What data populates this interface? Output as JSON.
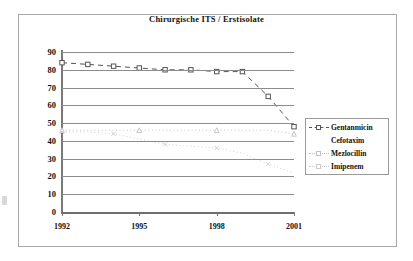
{
  "chart_data": {
    "type": "line",
    "title": "Chirurgische ITS / Erstisolate",
    "xlabel": "",
    "ylabel": "",
    "ylim": [
      0,
      90
    ],
    "yticks": [
      90,
      80,
      70,
      60,
      50,
      40,
      30,
      20,
      10,
      0
    ],
    "xticks": [
      "1992",
      "1995",
      "1998",
      "2001"
    ],
    "x": [
      1992,
      1993,
      1994,
      1995,
      1996,
      1997,
      1998,
      1999,
      2000,
      2001
    ],
    "grid": true,
    "legend_position": "right",
    "series": [
      {
        "name": "Gentanmicin",
        "marker": "square",
        "linestyle": "dashed",
        "color": "#555555",
        "values": [
          84,
          83,
          82,
          81,
          80,
          80,
          79,
          79,
          65,
          48
        ]
      },
      {
        "name": "Cefotaxim",
        "marker": "none",
        "linestyle": "none",
        "color": "#bfbfbf",
        "values": [
          null,
          null,
          null,
          null,
          null,
          null,
          null,
          null,
          null,
          null
        ]
      },
      {
        "name": "Mezlocillin",
        "marker": "triangle",
        "linestyle": "dotted",
        "color": "#c0c0c0",
        "values": [
          46,
          46,
          46,
          46,
          46,
          46,
          46,
          46,
          46,
          44
        ]
      },
      {
        "name": "Imipenem",
        "marker": "x",
        "linestyle": "dotted",
        "color": "#cccccc",
        "values": [
          45,
          45,
          44,
          41,
          38,
          37,
          36,
          33,
          27,
          22
        ]
      }
    ]
  },
  "legend": {
    "items": [
      {
        "label": "Gentanmicin"
      },
      {
        "label": "Cefotaxim"
      },
      {
        "label": "Mezlocillin"
      },
      {
        "label": "Imipenem"
      }
    ]
  },
  "axis": {
    "y_labels": [
      "90",
      "80",
      "70",
      "60",
      "50",
      "40",
      "30",
      "20",
      "10",
      "0"
    ],
    "x_labels": [
      "1992",
      "1995",
      "1998",
      "2001"
    ]
  }
}
